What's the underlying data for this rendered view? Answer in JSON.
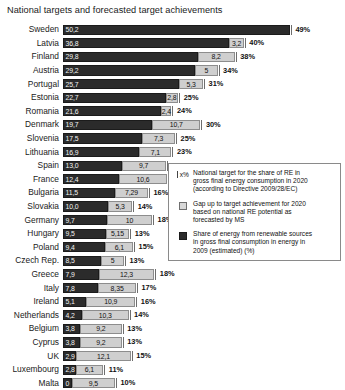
{
  "chart": {
    "title": "National targets and forecasted target achievements",
    "legend": {
      "items": [
        {
          "key": "x%",
          "key_type": "target-marker",
          "lines": [
            "National target for the share of RE in",
            "gross final energy consumption in 2020",
            "(according to Directive 2009/28/EC)"
          ]
        },
        {
          "key": "",
          "key_type": "gap-swatch",
          "lines": [
            "Gap up to target achievement for 2020",
            "based on national RE potential as",
            "forecasted by MS"
          ]
        },
        {
          "key": "",
          "key_type": "share-swatch",
          "lines": [
            "Share of energy from renewable sources",
            "in gross final consumption in energy in",
            "2009 (estimated) (%)"
          ]
        }
      ]
    }
  },
  "chart_data": {
    "type": "bar",
    "orientation": "horizontal",
    "stacked": true,
    "title": "National targets and forecasted target achievements",
    "xlabel": "",
    "ylabel": "",
    "xlim": [
      0,
      52
    ],
    "grid": false,
    "legend_position": "inside-bottom-right",
    "categories": [
      "Sweden",
      "Latvia",
      "Finland",
      "Austria",
      "Portugal",
      "Estonia",
      "Romania",
      "Denmark",
      "Slovenia",
      "Lithuania",
      "Spain",
      "France",
      "Bulgaria",
      "Slovakia",
      "Germany",
      "Hungary",
      "Poland",
      "Czech Rep.",
      "Greece",
      "Italy",
      "Ireland",
      "Netherlands",
      "Belgium",
      "Cyprus",
      "UK",
      "Luxembourg",
      "Malta"
    ],
    "series": [
      {
        "name": "Share of energy from renewable sources in gross final consumption in energy in 2009 (estimated) (%)",
        "color": "#2b2b2b",
        "values": [
          50.2,
          36.8,
          29.8,
          29.2,
          25.7,
          22.7,
          21.6,
          19.7,
          17.5,
          16.9,
          13.0,
          12.4,
          11.5,
          10.0,
          9.7,
          9.5,
          9.4,
          8.5,
          7.9,
          7.8,
          5.1,
          4.2,
          3.8,
          3.8,
          2.9,
          2.8,
          0.0
        ]
      },
      {
        "name": "Gap up to target achievement for 2020 based on national RE potential as forecasted by MS",
        "color": "#cfcfcf",
        "values": [
          0.0,
          3.2,
          8.2,
          5.0,
          5.3,
          2.8,
          2.4,
          10.7,
          7.3,
          7.1,
          9.7,
          10.6,
          7.29,
          5.3,
          10.0,
          5.15,
          6.1,
          5.0,
          12.3,
          8.35,
          10.9,
          10.3,
          9.2,
          9.2,
          12.1,
          6.1,
          9.5
        ]
      }
    ],
    "rows": [
      {
        "country": "Sweden",
        "share": 50.2,
        "share_label": "50,2",
        "gap": 0.0,
        "gap_label": "",
        "target": 49,
        "target_label": "49%"
      },
      {
        "country": "Latvia",
        "share": 36.8,
        "share_label": "36,8",
        "gap": 3.2,
        "gap_label": "3,2",
        "target": 40,
        "target_label": "40%"
      },
      {
        "country": "Finland",
        "share": 29.8,
        "share_label": "29,8",
        "gap": 8.2,
        "gap_label": "8,2",
        "target": 38,
        "target_label": "38%"
      },
      {
        "country": "Austria",
        "share": 29.2,
        "share_label": "29,2",
        "gap": 5.0,
        "gap_label": "5",
        "target": 34,
        "target_label": "34%"
      },
      {
        "country": "Portugal",
        "share": 25.7,
        "share_label": "25,7",
        "gap": 5.3,
        "gap_label": "5,3",
        "target": 31,
        "target_label": "31%"
      },
      {
        "country": "Estonia",
        "share": 22.7,
        "share_label": "22,7",
        "gap": 2.8,
        "gap_label": "2,8",
        "target": 25,
        "target_label": "25%"
      },
      {
        "country": "Romania",
        "share": 21.6,
        "share_label": "21,6",
        "gap": 2.4,
        "gap_label": "2,4",
        "target": 24,
        "target_label": "24%"
      },
      {
        "country": "Denmark",
        "share": 19.7,
        "share_label": "19,7",
        "gap": 10.7,
        "gap_label": "10,7",
        "target": 30,
        "target_label": "30%"
      },
      {
        "country": "Slovenia",
        "share": 17.5,
        "share_label": "17,5",
        "gap": 7.3,
        "gap_label": "7,3",
        "target": 25,
        "target_label": "25%"
      },
      {
        "country": "Lithuania",
        "share": 16.9,
        "share_label": "16,9",
        "gap": 7.1,
        "gap_label": "7,1",
        "target": 23,
        "target_label": "23%"
      },
      {
        "country": "Spain",
        "share": 13.0,
        "share_label": "13,0",
        "gap": 9.7,
        "gap_label": "9,7",
        "target": 20,
        "target_label": "20%"
      },
      {
        "country": "France",
        "share": 12.4,
        "share_label": "12,4",
        "gap": 10.6,
        "gap_label": "10,6",
        "target": 23,
        "target_label": "23%"
      },
      {
        "country": "Bulgaria",
        "share": 11.5,
        "share_label": "11,5",
        "gap": 7.29,
        "gap_label": "7,29",
        "target": 16,
        "target_label": "16%"
      },
      {
        "country": "Slovakia",
        "share": 10.0,
        "share_label": "10,0",
        "gap": 5.3,
        "gap_label": "5,3",
        "target": 14,
        "target_label": "14%"
      },
      {
        "country": "Germany",
        "share": 9.7,
        "share_label": "9,7",
        "gap": 10.0,
        "gap_label": "10",
        "target": 18,
        "target_label": "18%"
      },
      {
        "country": "Hungary",
        "share": 9.5,
        "share_label": "9,5",
        "gap": 5.15,
        "gap_label": "5,15",
        "target": 13,
        "target_label": "13%"
      },
      {
        "country": "Poland",
        "share": 9.4,
        "share_label": "9,4",
        "gap": 6.1,
        "gap_label": "6,1",
        "target": 15,
        "target_label": "15%"
      },
      {
        "country": "Czech Rep.",
        "share": 8.5,
        "share_label": "8,5",
        "gap": 5.0,
        "gap_label": "5",
        "target": 13,
        "target_label": "13%"
      },
      {
        "country": "Greece",
        "share": 7.9,
        "share_label": "7,9",
        "gap": 12.3,
        "gap_label": "12,3",
        "target": 18,
        "target_label": "18%"
      },
      {
        "country": "Italy",
        "share": 7.8,
        "share_label": "7,8",
        "gap": 8.35,
        "gap_label": "8,35",
        "target": 17,
        "target_label": "17%"
      },
      {
        "country": "Ireland",
        "share": 5.1,
        "share_label": "5,1",
        "gap": 10.9,
        "gap_label": "10,9",
        "target": 16,
        "target_label": "16%"
      },
      {
        "country": "Netherlands",
        "share": 4.2,
        "share_label": "4,2",
        "gap": 10.3,
        "gap_label": "10,3",
        "target": 14,
        "target_label": "14%"
      },
      {
        "country": "Belgium",
        "share": 3.8,
        "share_label": "3,8",
        "gap": 9.2,
        "gap_label": "9,2",
        "target": 13,
        "target_label": "13%"
      },
      {
        "country": "Cyprus",
        "share": 3.8,
        "share_label": "3,8",
        "gap": 9.2,
        "gap_label": "9,2",
        "target": 13,
        "target_label": "13%"
      },
      {
        "country": "UK",
        "share": 2.9,
        "share_label": "2,9",
        "gap": 12.1,
        "gap_label": "12,1",
        "target": 15,
        "target_label": "15%"
      },
      {
        "country": "Luxembourg",
        "share": 2.8,
        "share_label": "2,8",
        "gap": 6.1,
        "gap_label": "6,1",
        "target": 11,
        "target_label": "11%"
      },
      {
        "country": "Malta",
        "share": 0.0,
        "share_label": "0",
        "gap": 9.5,
        "gap_label": "9,5",
        "target": 10,
        "target_label": "10%"
      }
    ],
    "colors": {
      "share": "#2b2b2b",
      "gap": "#cfcfcf",
      "target_marker": "#6e6e6e"
    }
  }
}
